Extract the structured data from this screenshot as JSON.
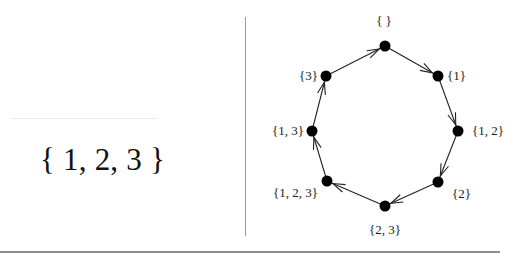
{
  "left_panel": {
    "set": "{ 1, 2, 3 }"
  },
  "graph": {
    "description": "Cycle of subsets (Gray-code style), directed clockwise",
    "nodes": [
      {
        "id": "empty",
        "label": "{ }",
        "x": 385,
        "y": 46,
        "lx": 384,
        "ly": 25,
        "anchor": "middle"
      },
      {
        "id": "s1",
        "label": "{1}",
        "x": 438,
        "y": 76,
        "lx": 447,
        "ly": 80,
        "anchor": "start"
      },
      {
        "id": "s12",
        "label": "{1, 2}",
        "x": 458,
        "y": 131,
        "lx": 472,
        "ly": 135,
        "anchor": "start"
      },
      {
        "id": "s2",
        "label": "{2}",
        "x": 438,
        "y": 182,
        "lx": 452,
        "ly": 198,
        "anchor": "start"
      },
      {
        "id": "s23",
        "label": "{2, 3}",
        "x": 385,
        "y": 206,
        "lx": 385,
        "ly": 234,
        "anchor": "middle"
      },
      {
        "id": "s123",
        "label": "{1, 2, 3}",
        "x": 327,
        "y": 181,
        "lx": 318,
        "ly": 197,
        "anchor": "end"
      },
      {
        "id": "s13",
        "label": "{1, 3}",
        "x": 312,
        "y": 131,
        "lx": 304,
        "ly": 135,
        "anchor": "end"
      },
      {
        "id": "s3",
        "label": "{3}",
        "x": 326,
        "y": 76,
        "lx": 318,
        "ly": 80,
        "anchor": "end"
      }
    ],
    "edges": [
      {
        "from": "empty",
        "to": "s1"
      },
      {
        "from": "s1",
        "to": "s12"
      },
      {
        "from": "s12",
        "to": "s2"
      },
      {
        "from": "s2",
        "to": "s23"
      },
      {
        "from": "s23",
        "to": "s123"
      },
      {
        "from": "s123",
        "to": "s13"
      },
      {
        "from": "s13",
        "to": "s3"
      },
      {
        "from": "s3",
        "to": "empty"
      }
    ],
    "colors": {
      "node": "#000000",
      "edge": "#222222"
    }
  }
}
